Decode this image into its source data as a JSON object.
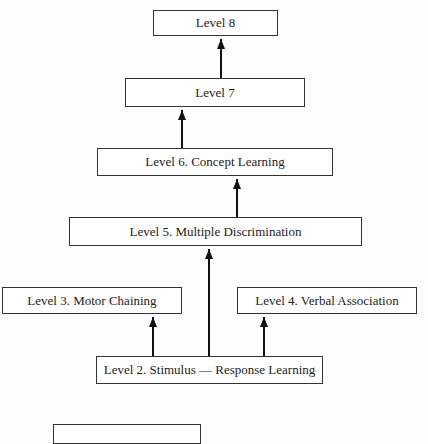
{
  "diagram": {
    "caption_fragment": "",
    "boxes": {
      "level8": "Level 8",
      "level7": "Level 7",
      "level6": "Level 6.  Concept Learning",
      "level5": "Level 5.  Multiple Discrimination",
      "level3": "Level 3.  Motor Chaining",
      "level4": "Level 4.  Verbal Association",
      "level2": "Level 2.  Stimulus — Response Learning",
      "level1": ""
    },
    "edges": [
      {
        "from": "level7",
        "to": "level8"
      },
      {
        "from": "level6",
        "to": "level7"
      },
      {
        "from": "level5",
        "to": "level6"
      },
      {
        "from": "level2",
        "to": "level5"
      },
      {
        "from": "level2",
        "to": "level3"
      },
      {
        "from": "level2",
        "to": "level4"
      }
    ]
  }
}
